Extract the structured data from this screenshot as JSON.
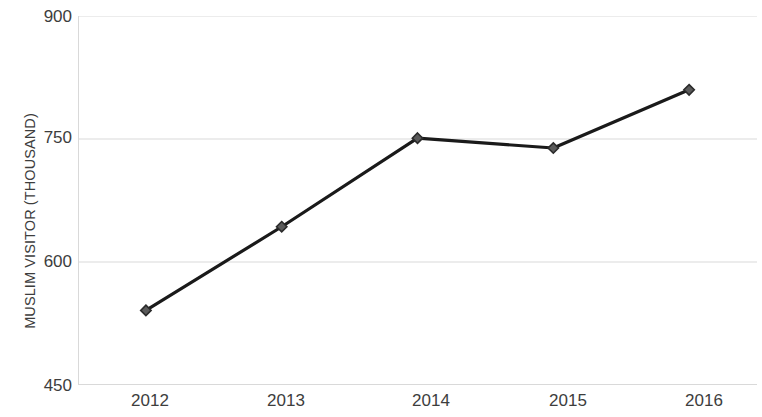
{
  "chart_data": {
    "type": "line",
    "title": "",
    "subtitle": "",
    "xlabel": "",
    "ylabel": "MUSLIM VISITOR (THOUSAND)",
    "categories": [
      "2012",
      "2013",
      "2014",
      "2015",
      "2016"
    ],
    "series": [
      {
        "name": "Muslim Visitor",
        "values": [
          541,
          643,
          751,
          739,
          810
        ]
      }
    ],
    "ylim": [
      450,
      900
    ],
    "y_ticks": [
      450,
      600,
      750,
      900
    ],
    "y_tick_labels": [
      "450",
      "600",
      "750",
      "900"
    ],
    "grid": true,
    "grid_axis": "y",
    "legend": false,
    "legend_position": "none",
    "marker": "diamond",
    "line_color": "#1a1a1a",
    "marker_color": "#2b2b2b",
    "grid_color": "#d9d9d9",
    "background_color": "#ffffff",
    "axis_text_color": "#3d3d3d"
  },
  "axes": {
    "y_title": "MUSLIM VISITOR (THOUSAND)",
    "y_tick_900": "900",
    "y_tick_750": "750",
    "y_tick_600": "600",
    "y_tick_450": "450",
    "x_tick_2012": "2012",
    "x_tick_2013": "2013",
    "x_tick_2014": "2014",
    "x_tick_2015": "2015",
    "x_tick_2016": "2016"
  }
}
